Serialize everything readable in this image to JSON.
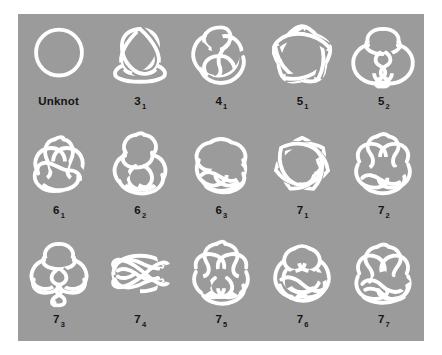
{
  "figure": {
    "background_color": "#9b9b9b",
    "stroke_color": "#ffffff",
    "label_color": "#141414",
    "page_background": "#ffffff",
    "columns": 5,
    "rows": 3
  },
  "knots": [
    {
      "name": "Unknot",
      "label": "Unknot",
      "main": "",
      "sub": "",
      "crossings": 0,
      "diagram": "unknot"
    },
    {
      "name": "3_1",
      "label": "3₁",
      "main": "3",
      "sub": "1",
      "crossings": 3,
      "diagram": "trefoil"
    },
    {
      "name": "4_1",
      "label": "4₁",
      "main": "4",
      "sub": "1",
      "crossings": 4,
      "diagram": "figure-eight"
    },
    {
      "name": "5_1",
      "label": "5₁",
      "main": "5",
      "sub": "1",
      "crossings": 5,
      "diagram": "cinquefoil-star"
    },
    {
      "name": "5_2",
      "label": "5₂",
      "main": "5",
      "sub": "2",
      "crossings": 5,
      "diagram": "three-twist"
    },
    {
      "name": "6_1",
      "label": "6₁",
      "main": "6",
      "sub": "1",
      "crossings": 6,
      "diagram": "stevedore"
    },
    {
      "name": "6_2",
      "label": "6₂",
      "main": "6",
      "sub": "2",
      "crossings": 6,
      "diagram": "six-two"
    },
    {
      "name": "6_3",
      "label": "6₃",
      "main": "6",
      "sub": "3",
      "crossings": 6,
      "diagram": "six-three"
    },
    {
      "name": "7_1",
      "label": "7₁",
      "main": "7",
      "sub": "1",
      "crossings": 7,
      "diagram": "septafoil-star"
    },
    {
      "name": "7_2",
      "label": "7₂",
      "main": "7",
      "sub": "2",
      "crossings": 7,
      "diagram": "seven-two"
    },
    {
      "name": "7_3",
      "label": "7₃",
      "main": "7",
      "sub": "3",
      "crossings": 7,
      "diagram": "seven-three"
    },
    {
      "name": "7_4",
      "label": "7₄",
      "main": "7",
      "sub": "4",
      "crossings": 7,
      "diagram": "seven-four-weave"
    },
    {
      "name": "7_5",
      "label": "7₅",
      "main": "7",
      "sub": "5",
      "crossings": 7,
      "diagram": "seven-five"
    },
    {
      "name": "7_6",
      "label": "7₆",
      "main": "7",
      "sub": "6",
      "crossings": 7,
      "diagram": "seven-six"
    },
    {
      "name": "7_7",
      "label": "7₇",
      "main": "7",
      "sub": "7",
      "crossings": 7,
      "diagram": "seven-seven"
    }
  ]
}
